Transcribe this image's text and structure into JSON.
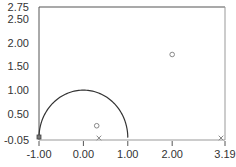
{
  "chart_data": {
    "type": "scatter",
    "title": "",
    "xlabel": "",
    "ylabel": "",
    "xlim": [
      -1.0,
      3.19
    ],
    "ylim": [
      -0.05,
      2.75
    ],
    "grid": false,
    "legend": null,
    "x_ticks": [
      "-1.00",
      "0.00",
      "1.00",
      "2.00",
      "3.19"
    ],
    "x_tick_values": [
      -1.0,
      0.0,
      1.0,
      2.0,
      3.19
    ],
    "y_ticks": [
      "2.75",
      "2.50",
      "2.00",
      "1.50",
      "1.00",
      "0.50",
      "-0.05"
    ],
    "y_tick_values": [
      2.75,
      2.5,
      2.0,
      1.5,
      1.0,
      0.5,
      -0.05
    ],
    "series": [
      {
        "name": "unit-circle",
        "type": "line",
        "description": "upper half of unit circle centered at origin",
        "center": [
          0,
          0
        ],
        "radius": 1.0
      },
      {
        "name": "poles-circles",
        "marker": "o",
        "points": [
          [
            0.3,
            0.25
          ],
          [
            2.0,
            1.75
          ]
        ]
      },
      {
        "name": "zeros-crosses",
        "marker": "x",
        "points": [
          [
            0.35,
            -0.05
          ],
          [
            3.1,
            -0.05
          ]
        ]
      },
      {
        "name": "origin-marker",
        "marker": "square",
        "points": [
          [
            -1.0,
            -0.05
          ]
        ]
      }
    ]
  },
  "colors": {
    "axis": "#555555",
    "frame": "#999999",
    "curve": "#333333",
    "marker": "#888888",
    "text": "#333333"
  }
}
